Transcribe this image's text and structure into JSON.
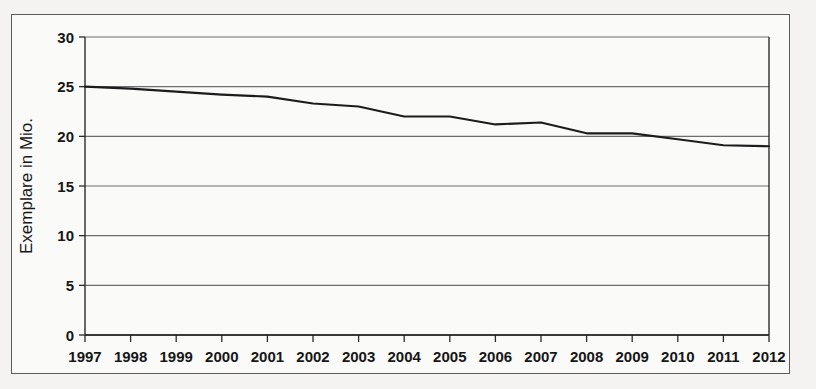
{
  "chart_data": {
    "type": "line",
    "title": "",
    "subtitle": "",
    "xlabel": "",
    "ylabel": "Exemplare in Mio.",
    "categories": [
      "1997",
      "1998",
      "1999",
      "2000",
      "2001",
      "2002",
      "2003",
      "2004",
      "2005",
      "2006",
      "2007",
      "2008",
      "2009",
      "2010",
      "2011",
      "2012"
    ],
    "x": [
      1997,
      1998,
      1999,
      2000,
      2001,
      2002,
      2003,
      2004,
      2005,
      2006,
      2007,
      2008,
      2009,
      2010,
      2011,
      2012
    ],
    "values": [
      25.0,
      24.8,
      24.5,
      24.2,
      24.0,
      23.3,
      23.0,
      22.0,
      22.0,
      21.2,
      21.4,
      20.3,
      20.3,
      19.7,
      19.1,
      19.0
    ],
    "series": [
      {
        "name": "Exemplare",
        "values": [
          25.0,
          24.8,
          24.5,
          24.2,
          24.0,
          23.3,
          23.0,
          22.0,
          22.0,
          21.2,
          21.4,
          20.3,
          20.3,
          19.7,
          19.1,
          19.0
        ]
      }
    ],
    "ylim": [
      0,
      30
    ],
    "yticks": [
      0,
      5,
      10,
      15,
      20,
      25,
      30
    ],
    "ytick_labels": [
      "0",
      "5",
      "10",
      "15",
      "20",
      "25",
      "30"
    ],
    "xlim": [
      1997,
      2012
    ],
    "grid": "horizontal",
    "legend": "none",
    "line_color": "#1c1c1c"
  },
  "figure": {
    "frame_visible": true
  },
  "background_text": {
    "lines": [
      "",
      "",
      "",
      "",
      "",
      ""
    ]
  }
}
